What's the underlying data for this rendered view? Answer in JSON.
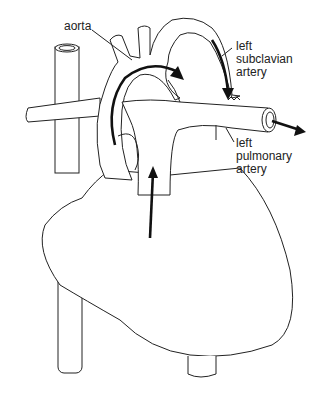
{
  "diagram": {
    "labels": {
      "aorta": "aorta",
      "left_subclavian_artery": "left\nsubclavian\nartery",
      "left_pulmonary_artery": "left\npulmonary\nartery"
    },
    "arrows": [
      {
        "name": "aortic-arch-flow",
        "direction": "clockwise over arch"
      },
      {
        "name": "subclavian-flow",
        "direction": "down"
      },
      {
        "name": "pulmonary-outflow",
        "direction": "right"
      },
      {
        "name": "ventricle-upflow",
        "direction": "up"
      }
    ],
    "colors": {
      "line": "#222222",
      "background": "#ffffff"
    }
  }
}
